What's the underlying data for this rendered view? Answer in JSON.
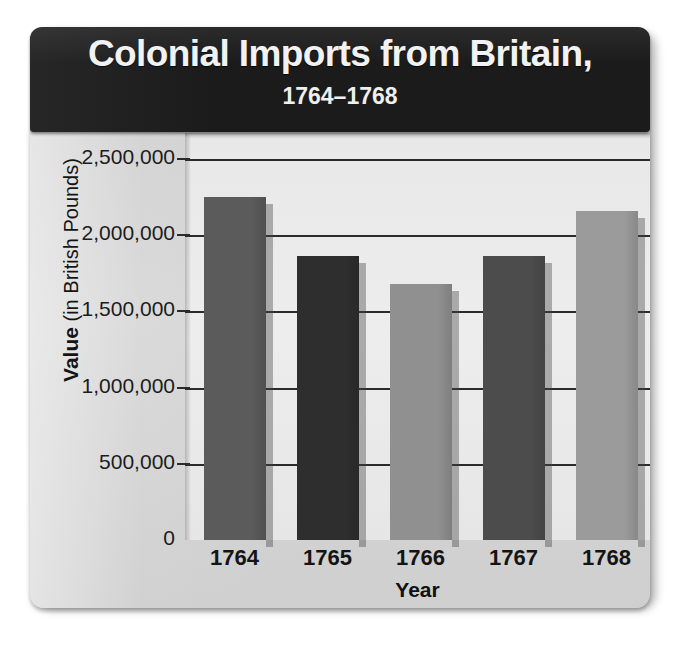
{
  "figure": {
    "title": "Colonial Imports from Britain,",
    "subtitle": "1764–1768",
    "axis_title_y_bold": "Value",
    "axis_title_y_rest": " (in British Pounds)",
    "axis_title_x": "Year"
  },
  "chart_data": {
    "type": "bar",
    "title": "Colonial Imports from Britain, 1764–1768",
    "xlabel": "Year",
    "ylabel": "Value (in British Pounds)",
    "categories": [
      "1764",
      "1765",
      "1766",
      "1767",
      "1768"
    ],
    "values": [
      2250000,
      1865000,
      1680000,
      1865000,
      2160000
    ],
    "ylim": [
      0,
      2500000
    ],
    "ytick_values": [
      0,
      500000,
      1000000,
      1500000,
      2000000,
      2500000
    ],
    "ytick_labels": [
      "0",
      "500,000",
      "1,000,000",
      "1,500,000",
      "2,000,000",
      "2,500,000"
    ],
    "grid": "horizontal",
    "legend": "none",
    "bar_colors": [
      "#5b5b5b",
      "#2e2e2e",
      "#909090",
      "#4c4c4c",
      "#9b9b9b"
    ]
  },
  "colors": {
    "banner_background": "#1b1b1b",
    "banner_text": "#f2f2f2",
    "panel_background": "#d4d4d4",
    "plot_background": "#eaeaea",
    "gridline": "#2b2b2b",
    "axis_text": "#141414"
  }
}
